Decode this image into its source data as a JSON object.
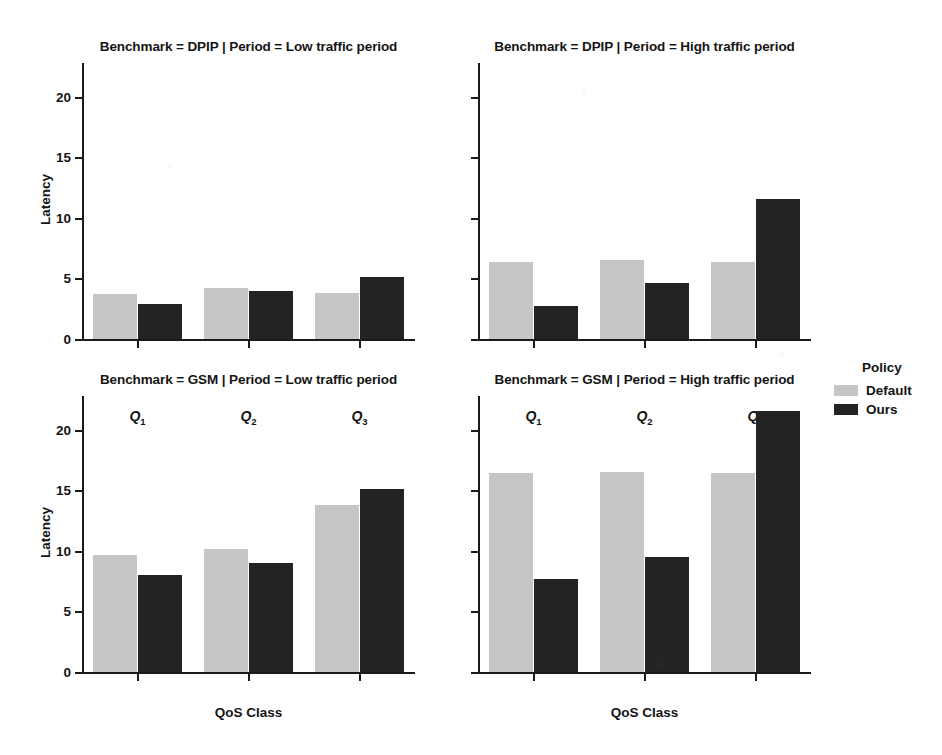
{
  "figure": {
    "legend": {
      "title": "Policy",
      "entries": [
        {
          "label": "Default",
          "color": "#c6c6c6"
        },
        {
          "label": "Ours",
          "color": "#232323"
        }
      ]
    },
    "panels": [
      {
        "title": "Benchmark = DPIP | Period = Low traffic period"
      },
      {
        "title": "Benchmark = DPIP | Period = High traffic period"
      },
      {
        "title": "Benchmark = GSM | Period = Low traffic period"
      },
      {
        "title": "Benchmark = GSM | Period = High traffic period"
      }
    ],
    "axis": {
      "ylabel": "Latency",
      "xlabel": "QoS Class",
      "yticks": [
        "0",
        "5",
        "10",
        "15",
        "20"
      ],
      "xticks": [
        "Q1",
        "Q2",
        "Q3"
      ]
    }
  },
  "chart_data": {
    "type": "bar",
    "title": "",
    "xlabel": "QoS Class",
    "ylabel": "Latency",
    "ylim": [
      0,
      22.8
    ],
    "ytick_values": [
      0,
      5,
      10,
      15,
      20
    ],
    "categories": [
      "Q1",
      "Q2",
      "Q3"
    ],
    "grid": false,
    "legend_position": "right",
    "legend_title": "Policy",
    "facet_rows": [
      "DPIP",
      "GSM"
    ],
    "facet_cols": [
      "Low traffic period",
      "High traffic period"
    ],
    "panels": [
      {
        "title": "Benchmark = DPIP | Period = Low traffic period",
        "benchmark": "DPIP",
        "period": "Low traffic period",
        "categories": [
          "Q1",
          "Q2",
          "Q3"
        ],
        "series": [
          {
            "name": "Default",
            "values": [
              3.7,
              4.2,
              3.8
            ]
          },
          {
            "name": "Ours",
            "values": [
              2.9,
              4.0,
              5.1
            ]
          }
        ]
      },
      {
        "title": "Benchmark = DPIP | Period = High traffic period",
        "benchmark": "DPIP",
        "period": "High traffic period",
        "categories": [
          "Q1",
          "Q2",
          "Q3"
        ],
        "series": [
          {
            "name": "Default",
            "values": [
              6.4,
              6.5,
              6.4
            ]
          },
          {
            "name": "Ours",
            "values": [
              2.7,
              4.6,
              11.6
            ]
          }
        ]
      },
      {
        "title": "Benchmark = GSM | Period = Low traffic period",
        "benchmark": "GSM",
        "period": "Low traffic period",
        "categories": [
          "Q1",
          "Q2",
          "Q3"
        ],
        "series": [
          {
            "name": "Default",
            "values": [
              9.7,
              10.2,
              13.8
            ]
          },
          {
            "name": "Ours",
            "values": [
              8.0,
              9.0,
              15.1
            ]
          }
        ]
      },
      {
        "title": "Benchmark = GSM | Period = High traffic period",
        "benchmark": "GSM",
        "period": "High traffic period",
        "categories": [
          "Q1",
          "Q2",
          "Q3"
        ],
        "series": [
          {
            "name": "Default",
            "values": [
              16.4,
              16.5,
              16.4
            ]
          },
          {
            "name": "Ours",
            "values": [
              7.7,
              9.5,
              21.6
            ]
          }
        ]
      }
    ]
  }
}
